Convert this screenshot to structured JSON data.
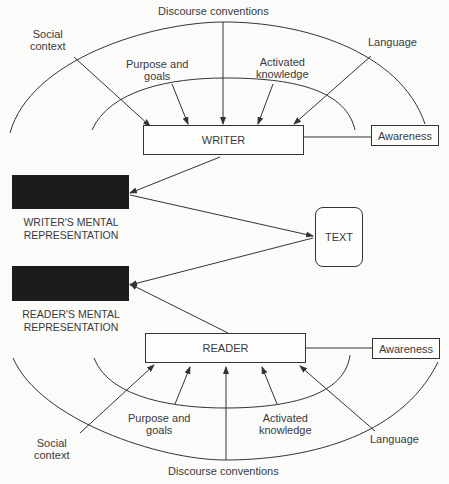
{
  "diagram": {
    "writer_side": {
      "node": "WRITER",
      "awareness": "Awareness",
      "influences": [
        {
          "label_line1": "Social",
          "label_line2": "context"
        },
        {
          "label_line1": "Purpose and",
          "label_line2": "goals"
        },
        {
          "label_line1": "Discourse conventions",
          "label_line2": ""
        },
        {
          "label_line1": "Activated",
          "label_line2": "knowledge"
        },
        {
          "label_line1": "Language",
          "label_line2": ""
        }
      ]
    },
    "reader_side": {
      "node": "READER",
      "awareness": "Awareness",
      "influences": [
        {
          "label_line1": "Social",
          "label_line2": "context"
        },
        {
          "label_line1": "Purpose and",
          "label_line2": "goals"
        },
        {
          "label_line1": "Discourse conventions",
          "label_line2": ""
        },
        {
          "label_line1": "Activated",
          "label_line2": "knowledge"
        },
        {
          "label_line1": "Language",
          "label_line2": ""
        }
      ]
    },
    "text_node": "TEXT",
    "writer_mental": {
      "line1": "WRITER'S MENTAL",
      "line2": "REPRESENTATION"
    },
    "reader_mental": {
      "line1": "READER'S MENTAL",
      "line2": "REPRESENTATION"
    }
  }
}
